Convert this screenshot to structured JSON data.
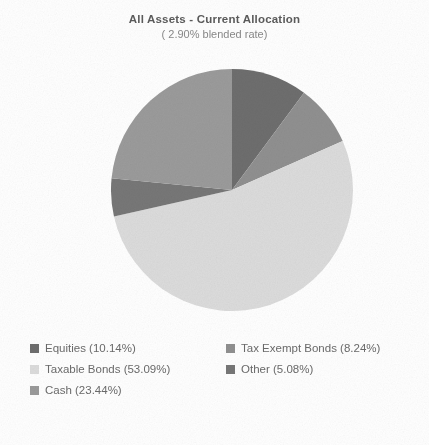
{
  "chart_data": {
    "type": "pie",
    "title": "All Assets - Current Allocation",
    "subtitle": "( 2.90% blended rate)",
    "categories": [
      "Equities",
      "Tax Exempt Bonds",
      "Taxable Bonds",
      "Other",
      "Cash"
    ],
    "values": [
      10.14,
      8.24,
      53.09,
      5.08,
      23.44
    ],
    "value_unit": "%",
    "start_angle_deg": 0,
    "direction": "clockwise",
    "grid": false,
    "legend_position": "bottom",
    "legend": [
      {
        "label": "Equities (10.14%)",
        "name": "Equities",
        "value": 10.14,
        "color": "#6e6e6e"
      },
      {
        "label": "Tax Exempt Bonds (8.24%)",
        "name": "Tax Exempt Bonds",
        "value": 8.24,
        "color": "#909090"
      },
      {
        "label": "Taxable Bonds (53.09%)",
        "name": "Taxable Bonds",
        "value": 53.09,
        "color": "#dcdcdc"
      },
      {
        "label": "Other (5.08%)",
        "name": "Other",
        "value": 5.08,
        "color": "#777777"
      },
      {
        "label": "Cash (23.44%)",
        "name": "Cash",
        "value": 23.44,
        "color": "#9b9b9b"
      }
    ],
    "slices": [
      {
        "name": "Equities",
        "value": 10.14,
        "color": "#6e6e6e"
      },
      {
        "name": "Tax Exempt Bonds",
        "value": 8.24,
        "color": "#909090"
      },
      {
        "name": "Taxable Bonds",
        "value": 53.09,
        "color": "#dcdcdc"
      },
      {
        "name": "Other",
        "value": 5.08,
        "color": "#777777"
      },
      {
        "name": "Cash",
        "value": 23.44,
        "color": "#9b9b9b"
      }
    ]
  }
}
